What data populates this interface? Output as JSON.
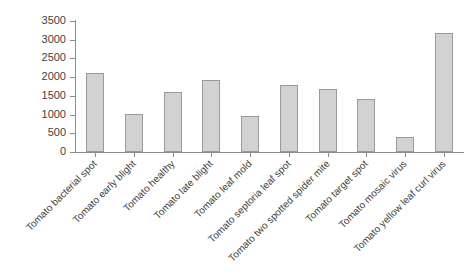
{
  "chart_data": {
    "type": "bar",
    "title": "",
    "subtitle": "",
    "xlabel": "",
    "ylabel": "",
    "categories": [
      "Tomato bacterial spot",
      "Tomato early blight",
      "Tomato healthy",
      "Tomato late blight",
      "Tomato leaf mold",
      "Tomato septoria leaf spot",
      "Tomato two spotted spider mite",
      "Tomato target spot",
      "Tomato mosaic virus",
      "Tomato yellow leaf curl virus"
    ],
    "values": [
      2120,
      1010,
      1600,
      1920,
      960,
      1790,
      1680,
      1410,
      390,
      3180
    ],
    "ylim": [
      0,
      3500
    ],
    "yticks": [
      0,
      500,
      1000,
      1500,
      2000,
      2500,
      3000,
      3500
    ],
    "ytick_labels": [
      "0",
      "500",
      "1000",
      "1500",
      "2000",
      "2500",
      "3000",
      "3500"
    ],
    "grid": false,
    "legend": null,
    "legend_position": "none",
    "xtick_label_rotation": -45,
    "bar_color": "#d2d2d2",
    "bar_edge_color": "#9a9a9a",
    "axis_color": "#8c8c8c",
    "background_color": "#ffffff",
    "annotations": []
  }
}
